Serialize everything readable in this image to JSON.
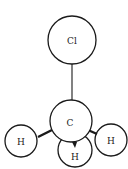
{
  "diagram": {
    "title": "",
    "molecule": "chloromethane",
    "atoms": {
      "cl": {
        "label": "Cl"
      },
      "c": {
        "label": "C"
      },
      "h_left": {
        "label": "H"
      },
      "h_bottom": {
        "label": "H"
      },
      "h_right": {
        "label": "H"
      }
    },
    "bonds": [
      {
        "from": "c",
        "to": "cl",
        "style": "line"
      },
      {
        "from": "c",
        "to": "h_left",
        "style": "wedge"
      },
      {
        "from": "c",
        "to": "h_bottom",
        "style": "wedge"
      },
      {
        "from": "c",
        "to": "h_right",
        "style": "wedge"
      }
    ]
  }
}
